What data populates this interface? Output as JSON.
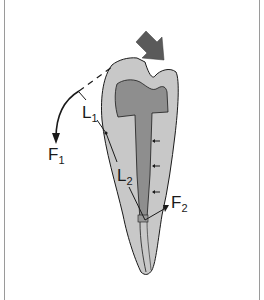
{
  "diagram": {
    "labels": {
      "L1": {
        "main": "L",
        "sub": "1"
      },
      "L2": {
        "main": "L",
        "sub": "2"
      },
      "F1": {
        "main": "F",
        "sub": "1"
      },
      "F2": {
        "main": "F",
        "sub": "2"
      }
    },
    "colors": {
      "background": "#ffffff",
      "frame": "#9a9a9a",
      "dentin": "#c8c8c8",
      "core": "#8e8e8e",
      "post": "#7a7a7a",
      "load_arrow": "#5a5a5a",
      "outline": "#1a1a1a"
    },
    "elements": [
      "load-arrow",
      "crown",
      "core-buildup",
      "post",
      "root",
      "lever-arm-L1",
      "lever-arm-L2",
      "force-arrow-F1",
      "force-arrow-F2",
      "lateral-pressure-arrows"
    ]
  }
}
